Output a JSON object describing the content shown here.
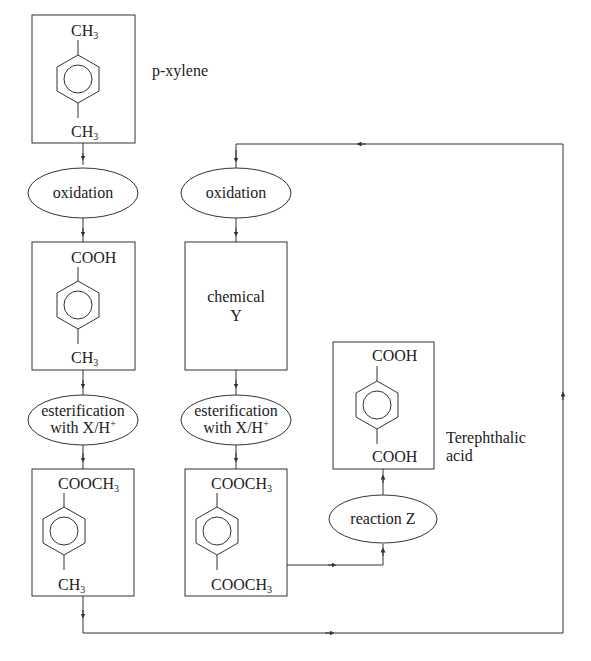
{
  "nodes": {
    "pxylene": {
      "top": "CH",
      "top_sub": "3",
      "bottom": "CH",
      "bottom_sub": "3",
      "label": "p-xylene"
    },
    "oxidation1": {
      "label": "oxidation"
    },
    "oxidation2": {
      "label": "oxidation"
    },
    "toluic_acid": {
      "top": "COOH",
      "bottom": "CH",
      "bottom_sub": "3"
    },
    "chemical_y": {
      "line1": "chemical",
      "line2": "Y"
    },
    "esterification1": {
      "line1": "esterification",
      "line2": "with X/H",
      "sup": "+"
    },
    "esterification2": {
      "line1": "esterification",
      "line2": "with X/H",
      "sup": "+"
    },
    "methyl_toluate": {
      "top": "COOCH",
      "top_sub": "3",
      "bottom": "CH",
      "bottom_sub": "3"
    },
    "dimethyl_terephthalate": {
      "top": "COOCH",
      "top_sub": "3",
      "bottom": "COOCH",
      "bottom_sub": "3"
    },
    "reaction_z": {
      "label": "reaction Z"
    },
    "terephthalic_acid": {
      "top": "COOH",
      "bottom": "COOH",
      "label_line1": "Terephthalic",
      "label_line2": "acid"
    }
  },
  "colors": {
    "line": "#333333",
    "text": "#222222",
    "background": "#ffffff"
  }
}
